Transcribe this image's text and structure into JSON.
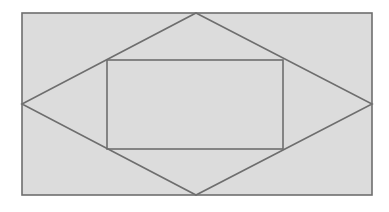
{
  "diagram": {
    "background": "#ffffff",
    "fill": "#dcdcdc",
    "stroke": "#6e6e6e",
    "stroke_width": 1.6,
    "outer_rect": {
      "x": 22,
      "y": 13,
      "width": 350,
      "height": 182
    },
    "diamond": {
      "points": "196,13 372,104 196,195 22,104"
    },
    "inner_rect": {
      "x": 107,
      "y": 60,
      "width": 176,
      "height": 89
    }
  }
}
